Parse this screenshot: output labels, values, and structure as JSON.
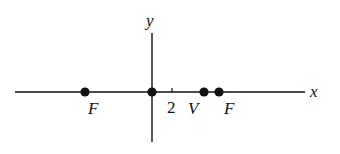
{
  "diagram": {
    "axes": {
      "x_label": "x",
      "y_label": "y",
      "tick_label": "2"
    },
    "points": [
      {
        "id": "focus-left",
        "label": "F",
        "px": 85
      },
      {
        "id": "origin",
        "label": "",
        "px": 152
      },
      {
        "id": "vertex",
        "label": "V",
        "px": 204
      },
      {
        "id": "focus-right",
        "label": "F",
        "px": 219
      }
    ],
    "colors": {
      "stroke": "#111111",
      "background": "#ffffff"
    }
  }
}
